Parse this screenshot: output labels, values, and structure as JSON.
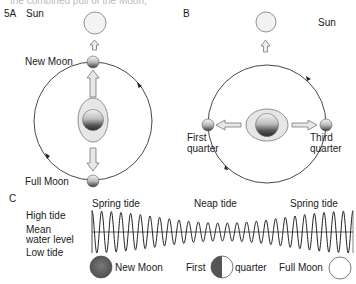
{
  "clipped_header": {
    "left": "the combined pull of the Moon,",
    "right": "like a dumbbell"
  },
  "panel_a": {
    "tag": "5A",
    "sun_label": "Sun",
    "new_moon_label": "New Moon",
    "full_moon_label": "Full Moon"
  },
  "panel_b": {
    "tag": "B",
    "sun_label": "Sun",
    "first_quarter_label_1": "First",
    "first_quarter_label_2": "quarter",
    "third_quarter_label_1": "Third",
    "third_quarter_label_2": "quarter"
  },
  "panel_c": {
    "tag": "C",
    "high_tide_label": "High tide",
    "mean_label_1": "Mean",
    "mean_label_2": "water level",
    "low_tide_label": "Low tide",
    "spring_tide_left": "Spring tide",
    "neap_tide": "Neap tide",
    "spring_tide_right": "Spring tide",
    "phases": {
      "new_moon": "New Moon",
      "first": "First",
      "quarter": "quarter",
      "full_moon": "Full Moon"
    }
  },
  "colors": {
    "line": "#333333",
    "moon_dark": "#555555",
    "bulge_fill": "#e6e6e6",
    "arrow_fill": "#e8e8e8",
    "sun_fill": "#f2f2f2"
  }
}
